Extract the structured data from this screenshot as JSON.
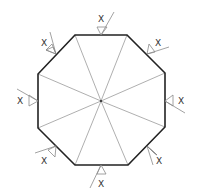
{
  "diagram": {
    "type": "octagon-weld-detail",
    "colors": {
      "outline": "#222222",
      "spoke": "#9a9a9a",
      "symbol": "#8a8a8a",
      "label": "#333333",
      "background": "#ffffff"
    },
    "center": {
      "x": 101,
      "y": 101
    },
    "vertices": [
      {
        "x": 75,
        "y": 35
      },
      {
        "x": 127,
        "y": 35
      },
      {
        "x": 165,
        "y": 73
      },
      {
        "x": 165,
        "y": 127
      },
      {
        "x": 128,
        "y": 165
      },
      {
        "x": 75,
        "y": 165
      },
      {
        "x": 38,
        "y": 128
      },
      {
        "x": 38,
        "y": 74
      }
    ],
    "weld_symbols": [
      {
        "position": "top",
        "label": "X"
      },
      {
        "position": "top-right",
        "label": "X"
      },
      {
        "position": "right",
        "label": "X"
      },
      {
        "position": "bottom-right",
        "label": "X"
      },
      {
        "position": "bottom",
        "label": "X"
      },
      {
        "position": "bottom-left",
        "label": "X"
      },
      {
        "position": "left",
        "label": "X"
      },
      {
        "position": "top-left",
        "label": "X"
      }
    ]
  }
}
